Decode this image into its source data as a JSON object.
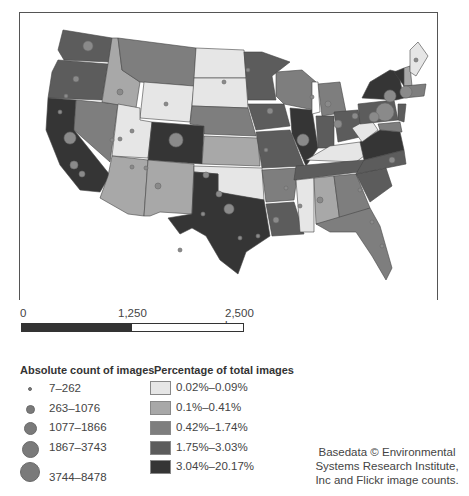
{
  "map": {
    "title": "Flickr image counts by US state",
    "scale_bar": {
      "labels": [
        "0",
        "1,250",
        "2,500 km"
      ]
    },
    "class_colors": {
      "c1": "#e6e6e6",
      "c2": "#a8a8a8",
      "c3": "#7e7e7e",
      "c4": "#5c5c5c",
      "c5": "#353535"
    },
    "dot_color": "#8a8a8a"
  },
  "legend": {
    "absolute": {
      "title": "Absolute count of images",
      "items": [
        {
          "label": "7–262",
          "size": 4
        },
        {
          "label": "263–1076",
          "size": 9
        },
        {
          "label": "1077–1866",
          "size": 14
        },
        {
          "label": "1867–3743",
          "size": 19
        },
        {
          "label": "3744–8478",
          "size": 26
        }
      ]
    },
    "percentage": {
      "title": "Percentage of total images",
      "items": [
        {
          "label": "0.02%–0.09%",
          "color": "#e6e6e6"
        },
        {
          "label": "0.1%–0.41%",
          "color": "#a8a8a8"
        },
        {
          "label": "0.42%–1.74%",
          "color": "#7e7e7e"
        },
        {
          "label": "1.75%–3.03%",
          "color": "#5c5c5c"
        },
        {
          "label": "3.04%–20.17%",
          "color": "#353535"
        }
      ]
    }
  },
  "credit": {
    "lines": [
      "Basedata © Environmental",
      "Systems Research Institute,",
      "Inc and Flickr image counts."
    ]
  }
}
